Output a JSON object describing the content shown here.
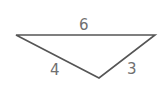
{
  "diagram": {
    "type": "triangle",
    "stroke_color": "#555555",
    "label_color": "#707070",
    "vertices": {
      "left": [
        16,
        35
      ],
      "right": [
        155,
        35
      ],
      "bottom": [
        99,
        78
      ]
    },
    "sides": [
      {
        "name": "top",
        "label": "6"
      },
      {
        "name": "left",
        "label": "4"
      },
      {
        "name": "right",
        "label": "3"
      }
    ]
  }
}
